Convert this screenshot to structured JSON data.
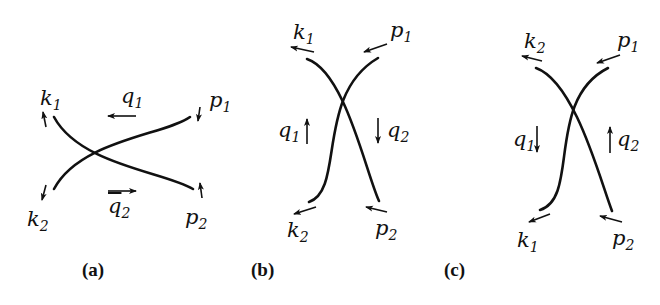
{
  "figure": {
    "panels": [
      {
        "id": "a",
        "caption": "(a)",
        "labels": {
          "k1": {
            "sym": "k",
            "sub": "1"
          },
          "k2": {
            "sym": "k",
            "sub": "2"
          },
          "p1": {
            "sym": "p",
            "sub": "1"
          },
          "p2": {
            "sym": "p",
            "sub": "2"
          },
          "q1": {
            "sym": "q",
            "sub": "1"
          },
          "q2": {
            "sym": "q",
            "sub": "2"
          }
        },
        "arrows": {
          "q1": "left",
          "q2": "right",
          "k1": "up",
          "k2": "down",
          "p1": "down",
          "p2": "up"
        }
      },
      {
        "id": "b",
        "caption": "(b)",
        "labels": {
          "k1": {
            "sym": "k",
            "sub": "1"
          },
          "k2": {
            "sym": "k",
            "sub": "2"
          },
          "p1": {
            "sym": "p",
            "sub": "1"
          },
          "p2": {
            "sym": "p",
            "sub": "2"
          },
          "q1": {
            "sym": "q",
            "sub": "1"
          },
          "q2": {
            "sym": "q",
            "sub": "2"
          }
        },
        "arrows": {
          "q1": "up",
          "q2": "down",
          "k1": "left",
          "k2": "left",
          "p1": "left",
          "p2": "left"
        }
      },
      {
        "id": "c",
        "caption": "(c)",
        "labels": {
          "k2": {
            "sym": "k",
            "sub": "2"
          },
          "k1": {
            "sym": "k",
            "sub": "1"
          },
          "p1": {
            "sym": "p",
            "sub": "1"
          },
          "p2": {
            "sym": "p",
            "sub": "2"
          },
          "q1": {
            "sym": "q",
            "sub": "1"
          },
          "q2": {
            "sym": "q",
            "sub": "2"
          }
        },
        "arrows": {
          "q1": "down",
          "q2": "up",
          "k2": "left",
          "k1": "left",
          "p1": "left",
          "p2": "left"
        }
      }
    ],
    "line_color": "#111111"
  }
}
